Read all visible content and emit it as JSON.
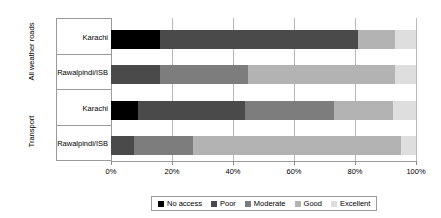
{
  "chart_data": {
    "type": "bar",
    "orientation": "horizontal",
    "stacked": true,
    "stack_mode": "percent",
    "title": "",
    "xlabel": "",
    "ylabel": "Access to services",
    "xlim": [
      0,
      100
    ],
    "xticks": [
      "0%",
      "20%",
      "40%",
      "60%",
      "80%",
      "100%"
    ],
    "xtick_values": [
      0,
      20,
      40,
      60,
      80,
      100
    ],
    "grid": true,
    "legend_position": "bottom",
    "groups": [
      {
        "label": "All weather roads",
        "categories": [
          "Karachi",
          "Rawalpindi/ISB"
        ]
      },
      {
        "label": "Transport",
        "categories": [
          "Karachi",
          "Rawalpindi/ISB"
        ]
      }
    ],
    "categories": [
      "Karachi",
      "Rawalpindi/ISB",
      "Karachi",
      "Rawalpindi/ISB"
    ],
    "series": [
      {
        "name": "No access",
        "color": "#000000",
        "values": [
          16,
          0,
          9,
          0
        ]
      },
      {
        "name": "Poor",
        "color": "#4a4a4a",
        "values": [
          65,
          16,
          35,
          7.5
        ]
      },
      {
        "name": "Moderate",
        "color": "#7d7d7d",
        "values": [
          0,
          29,
          29,
          19.5
        ]
      },
      {
        "name": "Good",
        "color": "#b3b3b3",
        "values": [
          12,
          48,
          19.5,
          68
        ]
      },
      {
        "name": "Excellent",
        "color": "#dedede",
        "values": [
          7,
          7,
          7.5,
          5
        ]
      }
    ]
  },
  "axis": {
    "y_outer_title": "Access to services",
    "groups": [
      "All weather roads",
      "Transport"
    ],
    "category_labels": [
      "Karachi",
      "Rawalpindi/ISB",
      "Karachi",
      "Rawalpindi/ISB"
    ],
    "x_tick_labels": [
      "0%",
      "20%",
      "40%",
      "60%",
      "80%",
      "100%"
    ]
  },
  "legend": {
    "items": [
      {
        "label": "No access",
        "color": "#000000"
      },
      {
        "label": "Poor",
        "color": "#4a4a4a"
      },
      {
        "label": "Moderate",
        "color": "#7d7d7d"
      },
      {
        "label": "Good",
        "color": "#b3b3b3"
      },
      {
        "label": "Excellent",
        "color": "#dedede"
      }
    ]
  },
  "colors": {
    "frame": "#9a9a9a",
    "grid": "#b9b9b9",
    "background": "#ffffff",
    "text": "#000000"
  }
}
